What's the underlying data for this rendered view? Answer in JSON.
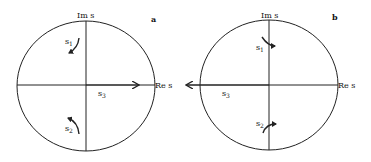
{
  "panels": [
    {
      "id": "a",
      "label": "a",
      "axis_imag": "Im s",
      "axis_real": "Re s",
      "s1": "s",
      "s1_sub": "1",
      "s2": "s",
      "s2_sub": "2",
      "s3": "s",
      "s3_sub": "3",
      "s3_direction": "right"
    },
    {
      "id": "b",
      "label": "b",
      "axis_imag": "Im s",
      "axis_real": "Re s",
      "s1": "s",
      "s1_sub": "1",
      "s2": "s",
      "s2_sub": "2",
      "s3": "s",
      "s3_sub": "3",
      "s3_direction": "left"
    }
  ],
  "colors": {
    "stroke": "#222222",
    "background": "#ffffff"
  }
}
